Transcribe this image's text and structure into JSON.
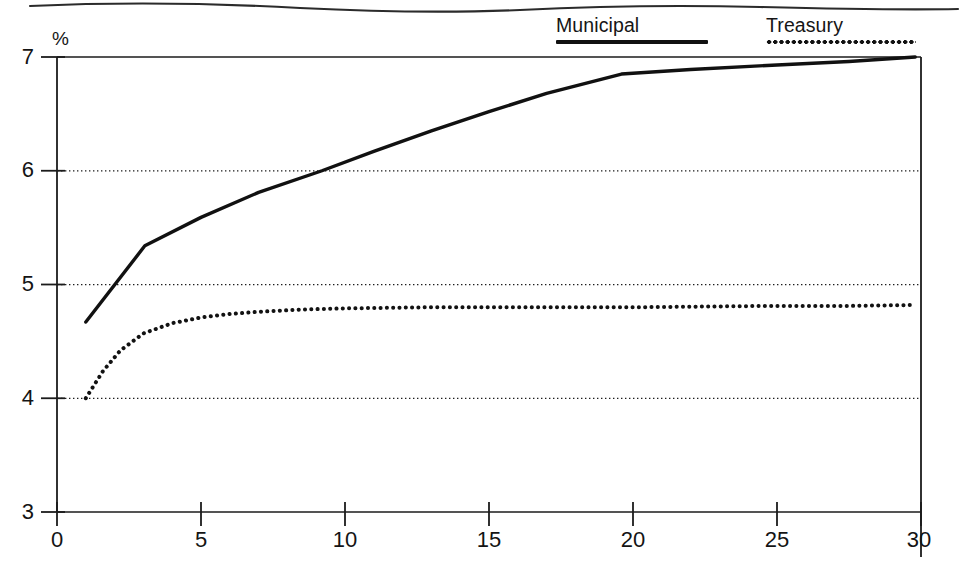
{
  "figure": {
    "has_top_rule": true,
    "background": "#ffffff",
    "ink_color": "#141414"
  },
  "legend": {
    "position": "top-right",
    "entries": [
      {
        "label": "Municipal",
        "style": "solid",
        "swatch_name": "solid-line-swatch"
      },
      {
        "label": "Treasury",
        "style": "dotted",
        "swatch_name": "dotted-line-swatch"
      }
    ]
  },
  "chart_data": {
    "type": "line",
    "title": "",
    "subtitle": "",
    "xlabel": "",
    "ylabel": "%",
    "xlim": [
      0,
      30
    ],
    "ylim": [
      3,
      7
    ],
    "xticks": [
      0,
      5,
      10,
      15,
      20,
      25,
      30
    ],
    "xticklabels": [
      "0",
      "5",
      "10",
      "15",
      "20",
      "25",
      "30"
    ],
    "yticks": [
      3,
      4,
      5,
      6,
      7
    ],
    "yticklabels": [
      "3",
      "4",
      "5",
      "6",
      "7"
    ],
    "grid": true,
    "gridlines": {
      "y_dotted": [
        4,
        5,
        6
      ],
      "y_solid": [
        3,
        7
      ]
    },
    "legend_position": "above-plot-right",
    "series": [
      {
        "name": "Municipal",
        "style": "solid",
        "color": "#111111",
        "x": [
          1.0,
          3.05,
          5.0,
          7.0,
          9.2,
          11.0,
          13.0,
          15.0,
          17.0,
          19.6,
          22.0,
          25.0,
          27.5,
          29.8
        ],
        "values": [
          4.67,
          5.34,
          5.59,
          5.81,
          6.0,
          6.17,
          6.35,
          6.52,
          6.68,
          6.85,
          6.89,
          6.93,
          6.96,
          7.0
        ]
      },
      {
        "name": "Treasury",
        "style": "dotted",
        "color": "#121212",
        "x": [
          1.0,
          1.6,
          2.2,
          3.0,
          4.0,
          5.0,
          6.0,
          7.0,
          8.5,
          10.0,
          13.0,
          16.0,
          20.0,
          24.0,
          27.0,
          29.8
        ],
        "values": [
          4.0,
          4.24,
          4.42,
          4.57,
          4.66,
          4.71,
          4.74,
          4.76,
          4.78,
          4.79,
          4.8,
          4.8,
          4.8,
          4.81,
          4.81,
          4.82
        ]
      }
    ]
  }
}
